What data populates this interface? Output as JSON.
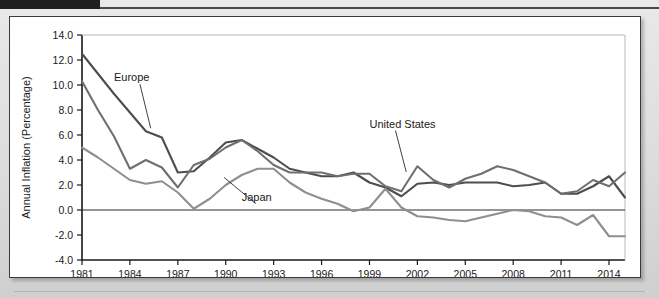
{
  "figure": {
    "header_swatch_color": "#1f1f1f",
    "card_background": "#ffffff",
    "page_background": "#dcdcdc"
  },
  "chart_data": {
    "type": "line",
    "title": "",
    "subtitle": "",
    "xlabel": "",
    "ylabel": "Annual Inflation (Percentage)",
    "xlim": [
      1981,
      2015
    ],
    "ylim": [
      -4.0,
      14.0
    ],
    "grid": false,
    "legend_position": "inline-annotations",
    "x_tick_labels": [
      "1981",
      "1984",
      "1987",
      "1990",
      "1993",
      "1996",
      "1999",
      "2002",
      "2005",
      "2008",
      "2011",
      "2014"
    ],
    "x_ticks": [
      1981,
      1984,
      1987,
      1990,
      1993,
      1996,
      1999,
      2002,
      2005,
      2008,
      2011,
      2014
    ],
    "y_tick_labels": [
      "14.0",
      "12.0",
      "10.0",
      "8.0",
      "6.0",
      "4.0",
      "2.0",
      "0.0",
      "-2.0",
      "-4.0"
    ],
    "y_ticks": [
      14.0,
      12.0,
      10.0,
      8.0,
      6.0,
      4.0,
      2.0,
      0.0,
      -2.0,
      -4.0
    ],
    "zero_line": 0.0,
    "x": [
      1981,
      1982,
      1983,
      1984,
      1985,
      1986,
      1987,
      1988,
      1989,
      1990,
      1991,
      1992,
      1993,
      1994,
      1995,
      1996,
      1997,
      1998,
      1999,
      2000,
      2001,
      2002,
      2003,
      2004,
      2005,
      2006,
      2007,
      2008,
      2009,
      2010,
      2011,
      2012,
      2013,
      2014,
      2015
    ],
    "series": [
      {
        "name": "Europe",
        "color": "#4d4d4d",
        "label_text": "Europe",
        "values": [
          12.5,
          10.9,
          9.3,
          7.8,
          6.3,
          5.8,
          3.0,
          3.1,
          4.2,
          5.4,
          5.6,
          4.9,
          4.2,
          3.3,
          3.0,
          2.7,
          2.7,
          3.0,
          2.2,
          1.8,
          1.1,
          2.1,
          2.2,
          2.0,
          2.2,
          2.2,
          2.2,
          1.9,
          2.0,
          2.2,
          1.3,
          1.3,
          1.9,
          2.7,
          1.0
        ]
      },
      {
        "name": "United States",
        "color": "#6f6f6f",
        "label_text": "United States",
        "values": [
          10.3,
          8.0,
          5.9,
          3.3,
          4.0,
          3.4,
          1.8,
          3.6,
          4.1,
          5.0,
          5.6,
          4.7,
          3.6,
          3.0,
          3.0,
          3.0,
          2.7,
          2.9,
          2.9,
          1.9,
          1.5,
          3.5,
          2.4,
          1.8,
          2.5,
          2.9,
          3.5,
          3.2,
          2.7,
          2.2,
          1.3,
          1.5,
          2.4,
          1.9,
          3.0
        ]
      },
      {
        "name": "Japan",
        "color": "#8f8f8f",
        "label_text": "Japan",
        "values": [
          5.0,
          4.2,
          3.3,
          2.4,
          2.1,
          2.3,
          1.4,
          0.1,
          0.9,
          2.0,
          2.8,
          3.3,
          3.3,
          2.2,
          1.4,
          0.9,
          0.5,
          -0.1,
          0.2,
          1.7,
          0.2,
          -0.5,
          -0.6,
          -0.8,
          -0.9,
          -0.6,
          -0.3,
          0.0,
          -0.1,
          -0.5,
          -0.6,
          -1.2,
          -0.4,
          -2.1,
          -2.1
        ]
      }
    ],
    "annotations": [
      {
        "text": "Europe",
        "series": "Europe",
        "anchor_x": 1984.0,
        "anchor_y": 9.6
      },
      {
        "text": "Japan",
        "series": "Japan",
        "anchor_x": 1990.6,
        "anchor_y": 1.0
      },
      {
        "text": "United States",
        "series": "United States",
        "anchor_x": 2000.4,
        "anchor_y": 6.1
      }
    ]
  }
}
